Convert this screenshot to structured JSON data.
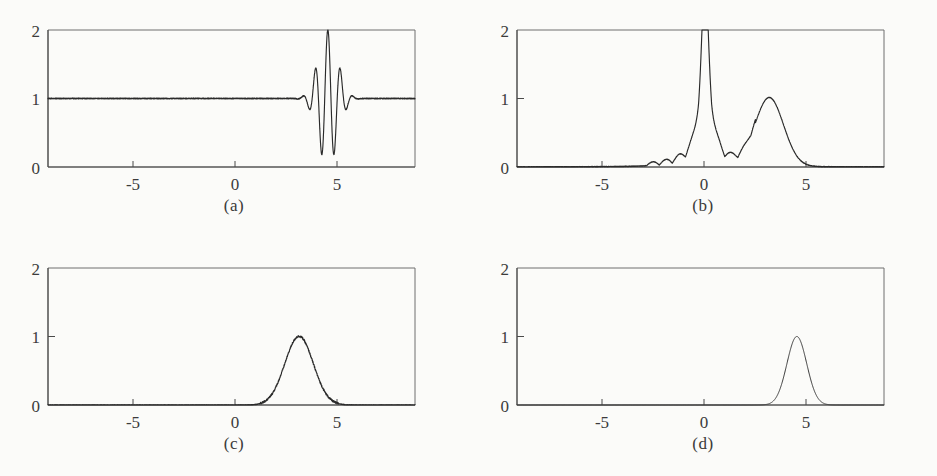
{
  "figure": {
    "background_color": "#fbfbf9",
    "ink_color": "#2a2a2a",
    "panel_count": 4
  },
  "panels": [
    {
      "id": "a",
      "caption": "(a)",
      "x_ticks": [
        "-5",
        "0",
        "5"
      ],
      "y_ticks": [
        "0",
        "1",
        "2"
      ]
    },
    {
      "id": "b",
      "caption": "(b)",
      "x_ticks": [
        "-5",
        "0",
        "5"
      ],
      "y_ticks": [
        "0",
        "1",
        "2"
      ]
    },
    {
      "id": "c",
      "caption": "(c)",
      "x_ticks": [
        "-5",
        "0",
        "5"
      ],
      "y_ticks": [
        "0",
        "1",
        "2"
      ]
    },
    {
      "id": "d",
      "caption": "(d)",
      "x_ticks": [
        "-5",
        "0",
        "5"
      ],
      "y_ticks": [
        "0",
        "1",
        "2"
      ]
    }
  ],
  "chart_data": [
    {
      "panel": "a",
      "type": "line",
      "title": "(a)",
      "xlabel": "",
      "ylabel": "",
      "xlim": [
        -8.2,
        7.8
      ],
      "ylim": [
        0,
        2
      ],
      "x_ticks": [
        -5,
        0,
        5
      ],
      "y_ticks": [
        0,
        1,
        2
      ],
      "grid": false,
      "legend": "none",
      "description": "Flat baseline at y=1 across the full range with a high-frequency oscillatory wave packet centred near x=4; envelope rises from ~0 amplitude at x=2.6 to full amplitude (0 to 2) at x=4 and decays by x=5.2.",
      "series": [
        {
          "name": "modulated carrier",
          "baseline": 1.0,
          "carrier_frequency": 11.5,
          "carrier_phase": 0.0,
          "envelope": {
            "type": "gaussian",
            "center": 4.0,
            "sigma": 0.42,
            "amplitude": 1.0
          },
          "noise_amplitude": 0.012
        }
      ]
    },
    {
      "panel": "b",
      "type": "line",
      "title": "(b)",
      "xlabel": "",
      "ylabel": "",
      "xlim": [
        -8.2,
        7.8
      ],
      "ylim": [
        0,
        2
      ],
      "x_ticks": [
        -5,
        0,
        5
      ],
      "y_ticks": [
        0,
        1,
        2
      ],
      "grid": false,
      "legend": "none",
      "description": "Sharp narrow peak at x=0 clipped at y=2 with decaying oscillatory sidelobes extending from about x=-2.5 to x=+2.2, plus a smooth broader peak at x=2.8 of height 1.",
      "series": [
        {
          "name": "central spike",
          "peak_x": 0.0,
          "peak_y": 2.0,
          "width": 0.33,
          "lineshape": "lorentzian-like"
        },
        {
          "name": "sidelobe ripples",
          "x_range": [
            -2.6,
            2.2
          ],
          "max_amplitude": 0.22,
          "ripple_frequency": 5.5,
          "envelope_decay": 0.55
        },
        {
          "name": "satellite peak",
          "peak_x": 2.8,
          "peak_y": 1.0,
          "width": 0.62,
          "lineshape": "gaussian"
        }
      ]
    },
    {
      "panel": "c",
      "type": "line",
      "title": "(c)",
      "xlabel": "",
      "ylabel": "",
      "xlim": [
        -8.2,
        7.8
      ],
      "ylim": [
        0,
        2
      ],
      "x_ticks": [
        -5,
        0,
        5
      ],
      "y_ticks": [
        0,
        1,
        2
      ],
      "grid": false,
      "legend": "none",
      "description": "Single noisy, slightly asymmetric peak at x=2.8 with height 1; zero elsewhere, with small noise bumps near the base at x=1.9 and x=3.9.",
      "series": [
        {
          "name": "noisy gaussian",
          "peak_x": 2.8,
          "peak_y": 1.0,
          "sigma": 0.62,
          "noise_amplitude": 0.03,
          "skew": -0.25
        }
      ]
    },
    {
      "panel": "d",
      "type": "line",
      "title": "(d)",
      "xlabel": "",
      "ylabel": "",
      "xlim": [
        -8.2,
        7.8
      ],
      "ylim": [
        0,
        2
      ],
      "x_ticks": [
        -5,
        0,
        5
      ],
      "y_ticks": [
        0,
        1,
        2
      ],
      "grid": false,
      "legend": "none",
      "description": "Single smooth clean Gaussian peak centred at x=4.0 with height 1; flat zero baseline elsewhere.",
      "series": [
        {
          "name": "clean gaussian",
          "peak_x": 4.0,
          "peak_y": 1.0,
          "sigma": 0.43,
          "noise_amplitude": 0.0
        }
      ]
    }
  ]
}
